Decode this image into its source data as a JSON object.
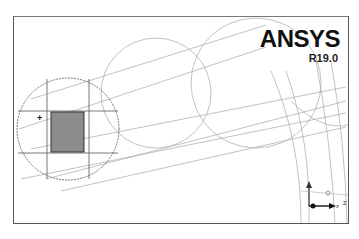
{
  "viewport": {
    "logo": {
      "brand": "ANSYS",
      "version": "R19.0"
    },
    "triad": {
      "x_label": "Z",
      "origin_label": "z"
    },
    "colors": {
      "frame": "#555555",
      "wire": "#9a9a9a",
      "dark_wire": "#555555",
      "section_fill": "#8c8c8c"
    }
  }
}
